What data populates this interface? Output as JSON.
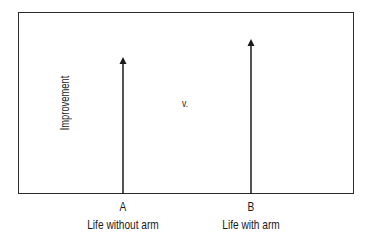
{
  "diagram": {
    "y_axis_label": "Improvement",
    "comparison_text": "v.",
    "options": [
      {
        "letter": "A",
        "description": "Life without arm",
        "arrow_x": 123,
        "arrow_top_y": 57
      },
      {
        "letter": "B",
        "description": "Life with arm",
        "arrow_x": 251,
        "arrow_top_y": 39
      }
    ],
    "baseline_y": 194,
    "colors": {
      "stroke": "#1a1a1a",
      "background": "#ffffff"
    }
  }
}
